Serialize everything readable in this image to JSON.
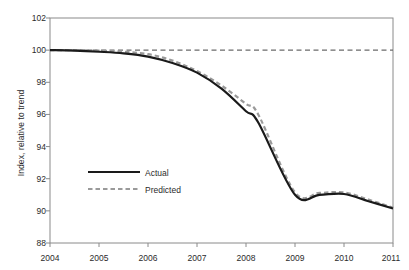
{
  "chart_data": {
    "type": "line",
    "title": "",
    "subtitle": "",
    "xlabel": "",
    "ylabel": "Index, relative to trend",
    "xlim": [
      2004,
      2011
    ],
    "ylim": [
      88,
      102
    ],
    "grid": false,
    "legend_position": "inside-left-lower",
    "x_ticks": [
      "2004",
      "2005",
      "2006",
      "2007",
      "2008",
      "2009",
      "2010",
      "2011"
    ],
    "y_ticks": [
      "88",
      "90",
      "92",
      "94",
      "96",
      "98",
      "100",
      "102"
    ],
    "x": [
      2004,
      2004.5,
      2005,
      2005.5,
      2006,
      2006.5,
      2007,
      2007.5,
      2008,
      2008.25,
      2009,
      2009.5,
      2010,
      2010.5,
      2011
    ],
    "reference_line": {
      "name": "trend",
      "value": 100,
      "style": "dashed",
      "color": "#6b6b6b"
    },
    "series": [
      {
        "name": "Actual",
        "style": "solid",
        "color": "#1a1a1a",
        "width": 2.2,
        "values": [
          100.0,
          99.97,
          99.9,
          99.8,
          99.6,
          99.2,
          98.6,
          97.6,
          96.2,
          95.5,
          91.0,
          91.0,
          91.05,
          90.6,
          90.15
        ]
      },
      {
        "name": "Predicted",
        "style": "dashed",
        "color": "#9a9a9a",
        "width": 2.2,
        "values": [
          100.0,
          100.0,
          99.97,
          99.9,
          99.75,
          99.35,
          98.7,
          97.8,
          96.65,
          96.0,
          91.15,
          91.12,
          91.15,
          90.7,
          90.2
        ]
      }
    ]
  },
  "legend": {
    "entries": [
      {
        "label": "Actual"
      },
      {
        "label": "Predicted"
      }
    ]
  },
  "axis": {
    "y_title": "Index, relative to trend"
  }
}
